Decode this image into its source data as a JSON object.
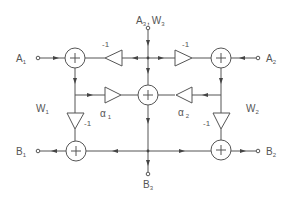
{
  "diagram": {
    "type": "signal-flow block diagram",
    "ports": {
      "a1": {
        "main": "A",
        "sub": "1"
      },
      "a2": {
        "main": "A",
        "sub": "2"
      },
      "a3w3": {
        "main1": "A",
        "sub1": "3",
        "sep": ",",
        "main2": "W",
        "sub2": "3"
      },
      "b1": {
        "main": "B",
        "sub": "1"
      },
      "b2": {
        "main": "B",
        "sub": "2"
      },
      "b3": {
        "main": "B",
        "sub": "3"
      }
    },
    "weights": {
      "w1": {
        "main": "W",
        "sub": "1"
      },
      "w2": {
        "main": "W",
        "sub": "2"
      }
    },
    "gains": {
      "top_left": "-1",
      "top_right": "-1",
      "vert_left": "-1",
      "vert_right": "-1",
      "alpha1": {
        "main": "α",
        "sub": "1"
      },
      "alpha2": {
        "main": "α",
        "sub": "2"
      }
    },
    "adders": [
      "adder-top-left",
      "adder-top-right",
      "adder-center",
      "adder-bottom-left",
      "adder-bottom-right"
    ],
    "adder_symbol": "+"
  }
}
